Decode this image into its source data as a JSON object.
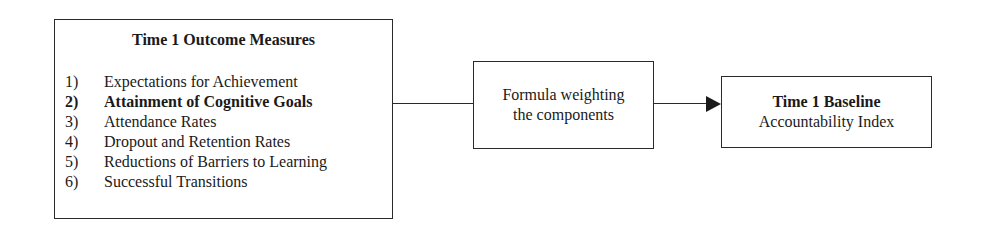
{
  "diagram": {
    "outcomes_box": {
      "title": "Time 1 Outcome Measures",
      "items": [
        {
          "num": "1)",
          "label": "Expectations for Achievement",
          "bold": false
        },
        {
          "num": "2)",
          "label": "Attainment of Cognitive Goals",
          "bold": true
        },
        {
          "num": "3)",
          "label": "Attendance Rates",
          "bold": false
        },
        {
          "num": "4)",
          "label": "Dropout and Retention Rates",
          "bold": false
        },
        {
          "num": "5)",
          "label": "Reductions of Barriers to Learning",
          "bold": false
        },
        {
          "num": "6)",
          "label": "Successful Transitions",
          "bold": false
        }
      ]
    },
    "formula_box": {
      "line1": "Formula weighting",
      "line2": "the components"
    },
    "index_box": {
      "line1": "Time 1 Baseline",
      "line2": "Accountability Index"
    },
    "edges": [
      {
        "from": "Time 1 Outcome Measures",
        "to": "Formula weighting the components",
        "arrow": false
      },
      {
        "from": "Formula weighting the components",
        "to": "Time 1 Baseline Accountability Index",
        "arrow": true
      }
    ],
    "colors": {
      "line": "#2a2a2a",
      "text": "#1a1a1a",
      "background": "#ffffff"
    }
  }
}
